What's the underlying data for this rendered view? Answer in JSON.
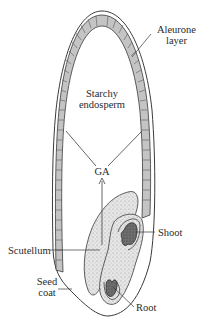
{
  "diagram": {
    "labels": {
      "aleurone_line1": "Aleurone",
      "aleurone_line2": "layer",
      "endosperm_line1": "Starchy",
      "endosperm_line2": "endosperm",
      "ga": "GA",
      "shoot": "Shoot",
      "scutellum": "Scutellum",
      "seed_coat_line1": "Seed",
      "seed_coat_line2": "coat",
      "root": "Root"
    },
    "colors": {
      "ink": "#3a3a3a",
      "cell_fill": "#bdbdbd",
      "scutellum_fill": "#e2e2e2",
      "embryo_tissue_fill": "#666666",
      "background": "#ffffff"
    }
  }
}
